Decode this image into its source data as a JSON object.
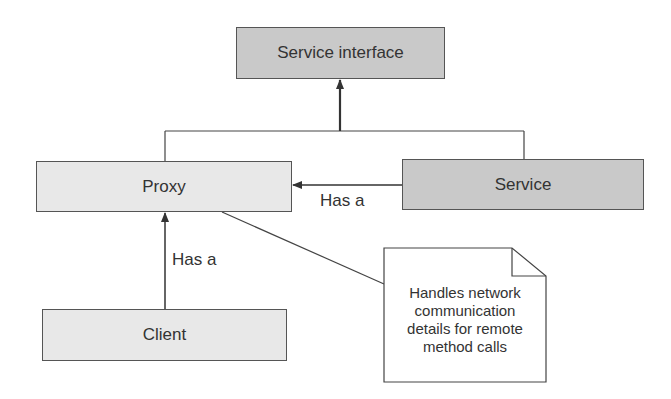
{
  "diagram": {
    "nodes": {
      "service_interface": "Service interface",
      "proxy": "Proxy",
      "service": "Service",
      "client": "Client"
    },
    "edges": {
      "service_to_proxy": "Has a",
      "client_to_proxy": "Has a"
    },
    "note": {
      "lines": [
        "Handles network",
        "communication",
        "details for remote",
        "method calls"
      ]
    },
    "colors": {
      "interface_fill": "#c9c9c9",
      "class_fill": "#e8e8e8",
      "stroke": "#555555"
    }
  }
}
